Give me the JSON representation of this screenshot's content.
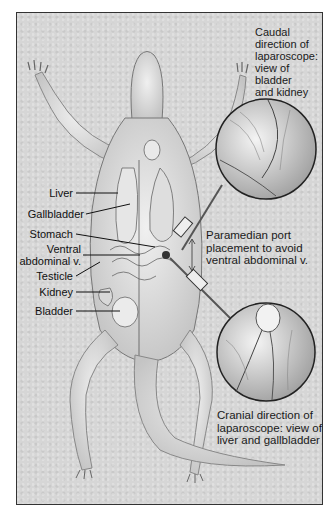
{
  "figure": {
    "colors": {
      "background": "#d6d6d6",
      "border": "#333333",
      "text": "#111111"
    },
    "captions": {
      "caudal": [
        "Caudal",
        "direction of",
        "laparoscope:",
        "view of",
        "bladder",
        "and kidney"
      ],
      "port": [
        "Paramedian port",
        "placement to avoid",
        "ventral abdominal v."
      ],
      "cranial": [
        "Cranial direction of",
        "laparoscope: view of",
        "liver and gallbladder"
      ]
    },
    "labels": [
      {
        "text": "Liver"
      },
      {
        "text": "Gallbladder"
      },
      {
        "text": "Stomach"
      },
      {
        "text": "Ventral"
      },
      {
        "text": "abdominal v."
      },
      {
        "text": "Testicle"
      },
      {
        "text": "Kidney"
      },
      {
        "text": "Bladder"
      }
    ],
    "insets": [
      {
        "name": "caudal-view-inset",
        "description": "magnified view of bladder and kidney"
      },
      {
        "name": "cranial-view-inset",
        "description": "magnified view of liver and gallbladder"
      }
    ]
  }
}
